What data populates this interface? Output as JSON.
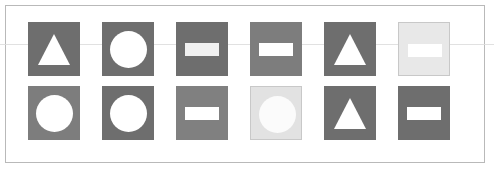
{
  "canvas": {
    "width": 494,
    "height": 171,
    "background_color": "#ffffff"
  },
  "frame": {
    "name": "outer-border",
    "x": 5,
    "y": 5,
    "width": 480,
    "height": 158,
    "border_color": "#b9b9b9",
    "border_width": 1
  },
  "scanline": {
    "y": 44,
    "color": "#dcdcdc"
  },
  "grid": {
    "columns": 6,
    "rows": 2,
    "tile_width": 52,
    "tile_height": 54,
    "column_x": [
      28,
      102,
      176,
      250,
      324,
      398
    ],
    "row_y": [
      22,
      86
    ]
  },
  "palette": {
    "dark_gray": "#6e6e6e",
    "medium_gray": "#7d7d7d",
    "gray": "#808080",
    "light_highlight": "#e8e8e8",
    "light_highlight_alt": "#e2e2e2",
    "shape_white": "#ffffff",
    "shape_offwhite": "#f7f7f7",
    "tile_outline": "#c8c8c8"
  },
  "tiles": [
    {
      "id": "tile-r1c1",
      "row": 1,
      "col": 1,
      "x": 28,
      "y": 22,
      "shape": "triangle",
      "tile_color": "#6e6e6e",
      "shape_color": "#ffffff",
      "outlined": false,
      "highlighted": false
    },
    {
      "id": "tile-r1c2",
      "row": 1,
      "col": 2,
      "x": 102,
      "y": 22,
      "shape": "circle",
      "tile_color": "#6e6e6e",
      "shape_color": "#ffffff",
      "outlined": false,
      "highlighted": false
    },
    {
      "id": "tile-r1c3",
      "row": 1,
      "col": 3,
      "x": 176,
      "y": 22,
      "shape": "rectangle",
      "tile_color": "#6e6e6e",
      "shape_color": "#f0f0f0",
      "outlined": false,
      "highlighted": false
    },
    {
      "id": "tile-r1c4",
      "row": 1,
      "col": 4,
      "x": 250,
      "y": 22,
      "shape": "rectangle",
      "tile_color": "#7d7d7d",
      "shape_color": "#ffffff",
      "outlined": false,
      "highlighted": false
    },
    {
      "id": "tile-r1c5",
      "row": 1,
      "col": 5,
      "x": 324,
      "y": 22,
      "shape": "triangle",
      "tile_color": "#6e6e6e",
      "shape_color": "#ffffff",
      "outlined": false,
      "highlighted": false
    },
    {
      "id": "tile-r1c6",
      "row": 1,
      "col": 6,
      "x": 398,
      "y": 22,
      "shape": "rectangle",
      "tile_color": "#e8e8e8",
      "shape_color": "#ffffff",
      "outlined": true,
      "highlighted": true
    },
    {
      "id": "tile-r2c1",
      "row": 2,
      "col": 1,
      "x": 28,
      "y": 86,
      "shape": "circle",
      "tile_color": "#7d7d7d",
      "shape_color": "#ffffff",
      "outlined": false,
      "highlighted": false
    },
    {
      "id": "tile-r2c2",
      "row": 2,
      "col": 2,
      "x": 102,
      "y": 86,
      "shape": "circle",
      "tile_color": "#6e6e6e",
      "shape_color": "#ffffff",
      "outlined": false,
      "highlighted": false
    },
    {
      "id": "tile-r2c3",
      "row": 2,
      "col": 3,
      "x": 176,
      "y": 86,
      "shape": "rectangle",
      "tile_color": "#808080",
      "shape_color": "#ffffff",
      "outlined": false,
      "highlighted": false
    },
    {
      "id": "tile-r2c4",
      "row": 2,
      "col": 4,
      "x": 250,
      "y": 86,
      "shape": "circle",
      "tile_color": "#e2e2e2",
      "shape_color": "#fbfbfb",
      "outlined": true,
      "highlighted": true
    },
    {
      "id": "tile-r2c5",
      "row": 2,
      "col": 5,
      "x": 324,
      "y": 86,
      "shape": "triangle",
      "tile_color": "#6e6e6e",
      "shape_color": "#ffffff",
      "outlined": false,
      "highlighted": false
    },
    {
      "id": "tile-r2c6",
      "row": 2,
      "col": 6,
      "x": 398,
      "y": 86,
      "shape": "rectangle",
      "tile_color": "#6e6e6e",
      "shape_color": "#ffffff",
      "outlined": false,
      "highlighted": false
    }
  ],
  "shape_geometry": {
    "circle": {
      "size_ratio": 0.72
    },
    "triangle": {
      "width_ratio": 0.62,
      "height_ratio": 0.58
    },
    "rectangle": {
      "width_ratio": 0.66,
      "height_ratio": 0.24
    }
  }
}
